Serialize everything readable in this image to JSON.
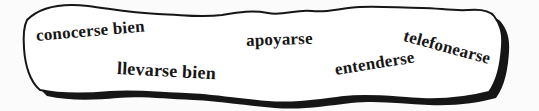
{
  "colors": {
    "ink": "#161616",
    "paper": "#ffffff",
    "page": "#fbfbfb"
  },
  "banner": {
    "description": "hand-drawn wavy vocabulary banner",
    "words": [
      {
        "label": "conocerse bien"
      },
      {
        "label": "llevarse bien"
      },
      {
        "label": "apoyarse"
      },
      {
        "label": "entenderse"
      },
      {
        "label": "telefonearse"
      }
    ]
  }
}
